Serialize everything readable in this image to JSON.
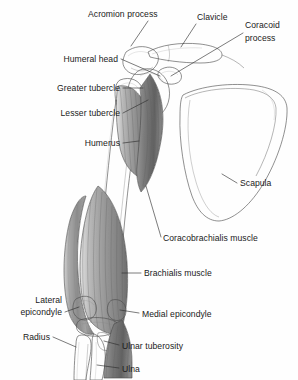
{
  "figure": {
    "style": "grayscale medical line illustration with graded shading",
    "background_color": "#fefefe",
    "line_color": "#2b2b2b",
    "label_color": "#1a1a1a"
  },
  "labels": [
    {
      "id": "acromion-process",
      "text": "Acromion process",
      "align": "start",
      "x": 88,
      "y": 17,
      "leader": "M148,21 L131,46",
      "target_structure": "acromion"
    },
    {
      "id": "clavicle",
      "text": "Clavicle",
      "align": "start",
      "x": 197,
      "y": 20,
      "leader": "M196,24 L181,47",
      "target_structure": "clavicle"
    },
    {
      "id": "coracoid-process",
      "text": "Coracoid",
      "text_line2": "process",
      "align": "start",
      "x": 245,
      "y": 28,
      "x2": 245,
      "y2": 41,
      "leader": "M243,33 L171,76",
      "target_structure": "coracoid process"
    },
    {
      "id": "humeral-head",
      "text": "Humeral head",
      "align": "end",
      "x": 118,
      "y": 62,
      "leader": "M121,59 L160,76",
      "target_structure": "head of humerus"
    },
    {
      "id": "greater-tubercle",
      "text": "Greater tubercle",
      "align": "end",
      "x": 120,
      "y": 91,
      "leader": "M123,88 L143,88",
      "target_structure": "greater tubercle"
    },
    {
      "id": "lesser-tubercle",
      "text": "Lesser tubercle",
      "align": "end",
      "x": 120,
      "y": 116,
      "leader": "M123,113 L148,100",
      "target_structure": "lesser tubercle"
    },
    {
      "id": "humerus",
      "text": "Humerus",
      "align": "end",
      "x": 120,
      "y": 146,
      "leader": "M123,143 L139,141",
      "target_structure": "humerus shaft"
    },
    {
      "id": "scapula",
      "text": "Scapula",
      "align": "start",
      "x": 240,
      "y": 186,
      "leader": "M237,183 L222,174",
      "target_structure": "scapula body"
    },
    {
      "id": "coracobrachialis-muscle",
      "text": "Coracobrachialis muscle",
      "align": "start",
      "x": 163,
      "y": 241,
      "leader": "M161,237 L146,186",
      "target_structure": "coracobrachialis muscle"
    },
    {
      "id": "brachialis-muscle",
      "text": "Brachialis muscle",
      "align": "start",
      "x": 144,
      "y": 276,
      "leader": "M141,273 L122,273",
      "target_structure": "brachialis muscle"
    },
    {
      "id": "lateral-epicondyle",
      "text": "Lateral",
      "text_line2": "epicondyle",
      "align": "end",
      "x": 62,
      "y": 303,
      "x2": 62,
      "y2": 315,
      "leader": "M65,312 L79,307",
      "target_structure": "lateral epicondyle"
    },
    {
      "id": "medial-epicondyle",
      "text": "Medial epicondyle",
      "align": "start",
      "x": 142,
      "y": 317,
      "leader": "M139,313 L120,310",
      "target_structure": "medial epicondyle"
    },
    {
      "id": "radius",
      "text": "Radius",
      "align": "end",
      "x": 50,
      "y": 340,
      "leader": "M53,337 L76,347",
      "target_structure": "radius"
    },
    {
      "id": "ulnar-tuberosity",
      "text": "Ulnar tuberosity",
      "align": "start",
      "x": 122,
      "y": 349,
      "leader": "M119,345 L104,341",
      "target_structure": "ulnar tuberosity"
    },
    {
      "id": "ulna",
      "text": "Ulna",
      "align": "start",
      "x": 122,
      "y": 372,
      "leader": "M119,368 L97,365",
      "target_structure": "ulna"
    }
  ],
  "structures": [
    {
      "id": "clavicle",
      "name": "Clavicle",
      "kind": "bone"
    },
    {
      "id": "acromion",
      "name": "Acromion process",
      "kind": "bone"
    },
    {
      "id": "coracoid",
      "name": "Coracoid process",
      "kind": "bone"
    },
    {
      "id": "humeral-head",
      "name": "Humeral head",
      "kind": "bone"
    },
    {
      "id": "greater-tubercle",
      "name": "Greater tubercle",
      "kind": "bone"
    },
    {
      "id": "lesser-tubercle",
      "name": "Lesser tubercle",
      "kind": "bone"
    },
    {
      "id": "humerus",
      "name": "Humerus",
      "kind": "bone"
    },
    {
      "id": "scapula",
      "name": "Scapula",
      "kind": "bone"
    },
    {
      "id": "coracobrachialis",
      "name": "Coracobrachialis muscle",
      "kind": "muscle"
    },
    {
      "id": "brachialis",
      "name": "Brachialis muscle",
      "kind": "muscle"
    },
    {
      "id": "lateral-epicondyle",
      "name": "Lateral epicondyle",
      "kind": "bone"
    },
    {
      "id": "medial-epicondyle",
      "name": "Medial epicondyle",
      "kind": "bone"
    },
    {
      "id": "radius",
      "name": "Radius",
      "kind": "bone"
    },
    {
      "id": "ulnar-tuberosity",
      "name": "Ulnar tuberosity",
      "kind": "bone"
    },
    {
      "id": "ulna",
      "name": "Ulna",
      "kind": "bone"
    }
  ]
}
